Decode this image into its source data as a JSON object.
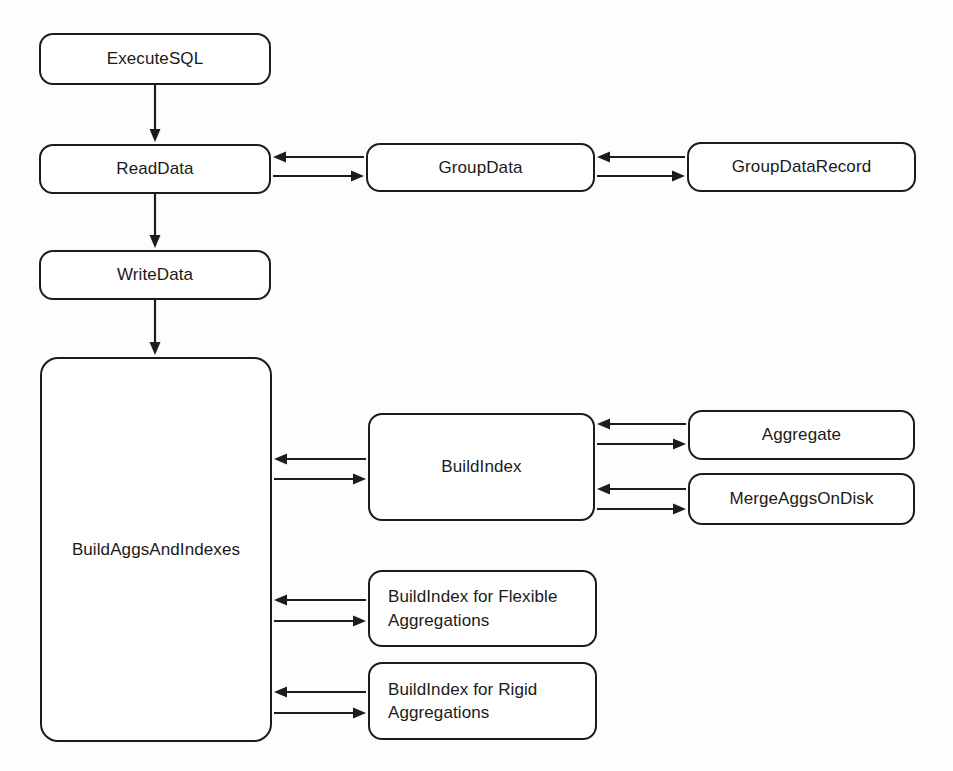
{
  "diagram": {
    "background_color": "#fdfdfd",
    "stroke_color": "#1c1c1c",
    "text_color": "#1a1a1a",
    "nodes": [
      {
        "id": "execute_sql",
        "label": "ExecuteSQL",
        "x": 39,
        "y": 33,
        "w": 232,
        "h": 52
      },
      {
        "id": "read_data",
        "label": "ReadData",
        "x": 39,
        "y": 144,
        "w": 232,
        "h": 50
      },
      {
        "id": "write_data",
        "label": "WriteData",
        "x": 39,
        "y": 250,
        "w": 232,
        "h": 50
      },
      {
        "id": "build_aggs_and_indexes",
        "label": "BuildAggsAndIndexes",
        "x": 40,
        "y": 357,
        "w": 232,
        "h": 385
      },
      {
        "id": "group_data",
        "label": "GroupData",
        "x": 366,
        "y": 143,
        "w": 229,
        "h": 49
      },
      {
        "id": "group_data_record",
        "label": "GroupDataRecord",
        "x": 687,
        "y": 142,
        "w": 229,
        "h": 50
      },
      {
        "id": "build_index",
        "label": "BuildIndex",
        "x": 368,
        "y": 413,
        "w": 227,
        "h": 108
      },
      {
        "id": "aggregate",
        "label": "Aggregate",
        "x": 688,
        "y": 410,
        "w": 227,
        "h": 50
      },
      {
        "id": "merge_aggs_on_disk",
        "label": "MergeAggsOnDisk",
        "x": 688,
        "y": 473,
        "w": 227,
        "h": 52
      },
      {
        "id": "build_index_flexible",
        "label": "BuildIndex for Flexible\nAggregations",
        "x": 368,
        "y": 570,
        "w": 229,
        "h": 77
      },
      {
        "id": "build_index_rigid",
        "label": "BuildIndex for Rigid\nAggregations",
        "x": 368,
        "y": 662,
        "w": 229,
        "h": 78
      }
    ],
    "edges": [
      {
        "id": "execute_sql-to-read_data",
        "from": "execute_sql",
        "to": "read_data",
        "kind": "vertical-arrow",
        "direction": "down",
        "x": 155,
        "y1": 85,
        "y2": 142
      },
      {
        "id": "read_data-to-write_data",
        "from": "read_data",
        "to": "write_data",
        "kind": "vertical-arrow",
        "direction": "down",
        "x": 155,
        "y1": 194,
        "y2": 248
      },
      {
        "id": "write_data-to-build_aggs",
        "from": "write_data",
        "to": "build_aggs_and_indexes",
        "kind": "vertical-arrow",
        "direction": "down",
        "x": 155,
        "y1": 300,
        "y2": 355
      },
      {
        "id": "group_data-to-read_data",
        "from": "group_data",
        "to": "read_data",
        "kind": "horizontal-arrow",
        "direction": "left",
        "y": 157,
        "x1": 364,
        "x2": 273
      },
      {
        "id": "read_data-to-group_data",
        "from": "read_data",
        "to": "group_data",
        "kind": "horizontal-arrow",
        "direction": "right",
        "y": 176,
        "x1": 273,
        "x2": 364
      },
      {
        "id": "group_data_record-to-group_data",
        "from": "group_data_record",
        "to": "group_data",
        "kind": "horizontal-arrow",
        "direction": "left",
        "y": 157,
        "x1": 685,
        "x2": 597
      },
      {
        "id": "group_data-to-group_data_record",
        "from": "group_data",
        "to": "group_data_record",
        "kind": "horizontal-arrow",
        "direction": "right",
        "y": 176,
        "x1": 597,
        "x2": 685
      },
      {
        "id": "build_index-to-build_aggs",
        "from": "build_index",
        "to": "build_aggs_and_indexes",
        "kind": "horizontal-arrow",
        "direction": "left",
        "y": 459,
        "x1": 366,
        "x2": 274
      },
      {
        "id": "build_aggs-to-build_index",
        "from": "build_aggs_and_indexes",
        "to": "build_index",
        "kind": "horizontal-arrow",
        "direction": "right",
        "y": 479,
        "x1": 274,
        "x2": 366
      },
      {
        "id": "aggregate-to-build_index",
        "from": "aggregate",
        "to": "build_index",
        "kind": "horizontal-arrow",
        "direction": "left",
        "y": 424,
        "x1": 686,
        "x2": 597
      },
      {
        "id": "build_index-to-aggregate",
        "from": "build_index",
        "to": "aggregate",
        "kind": "horizontal-arrow",
        "direction": "right",
        "y": 444,
        "x1": 597,
        "x2": 686
      },
      {
        "id": "merge_aggs-to-build_index",
        "from": "merge_aggs_on_disk",
        "to": "build_index",
        "kind": "horizontal-arrow",
        "direction": "left",
        "y": 489,
        "x1": 686,
        "x2": 597
      },
      {
        "id": "build_index-to-merge_aggs",
        "from": "build_index",
        "to": "merge_aggs_on_disk",
        "kind": "horizontal-arrow",
        "direction": "right",
        "y": 509,
        "x1": 597,
        "x2": 686
      },
      {
        "id": "flexible-to-build_aggs",
        "from": "build_index_flexible",
        "to": "build_aggs_and_indexes",
        "kind": "horizontal-arrow",
        "direction": "left",
        "y": 600,
        "x1": 366,
        "x2": 274
      },
      {
        "id": "build_aggs-to-flexible",
        "from": "build_aggs_and_indexes",
        "to": "build_index_flexible",
        "kind": "horizontal-arrow",
        "direction": "right",
        "y": 621,
        "x1": 274,
        "x2": 366
      },
      {
        "id": "rigid-to-build_aggs",
        "from": "build_index_rigid",
        "to": "build_aggs_and_indexes",
        "kind": "horizontal-arrow",
        "direction": "left",
        "y": 692,
        "x1": 366,
        "x2": 274
      },
      {
        "id": "build_aggs-to-rigid",
        "from": "build_aggs_and_indexes",
        "to": "build_index_rigid",
        "kind": "horizontal-arrow",
        "direction": "right",
        "y": 713,
        "x1": 274,
        "x2": 366
      }
    ]
  }
}
